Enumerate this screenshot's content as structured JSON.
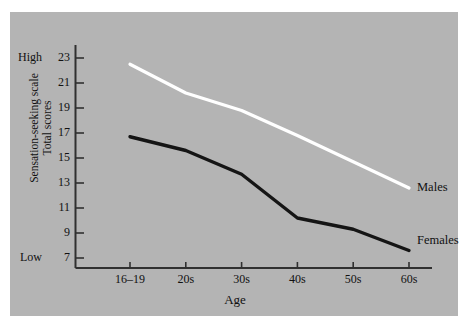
{
  "figure": {
    "background_color": "#b4b4b4",
    "page_color": "#ffffff"
  },
  "axes": {
    "y_title_line1": "Sensation-seeking scale",
    "y_title_line2": "Total scores",
    "y_high_anchor": "High",
    "y_low_anchor": "Low",
    "x_title": "Age"
  },
  "series_labels": {
    "males": "Males",
    "females": "Females"
  },
  "chart_data": {
    "type": "line",
    "title": "",
    "xlabel": "Age",
    "ylabel": "Sensation-seeking scale Total scores",
    "categories": [
      "16–19",
      "20s",
      "30s",
      "40s",
      "50s",
      "60s"
    ],
    "ytick_labels": [
      "23",
      "21",
      "19",
      "17",
      "15",
      "13",
      "11",
      "9",
      "7"
    ],
    "ytick_values": [
      23,
      21,
      19,
      17,
      15,
      13,
      11,
      9,
      7
    ],
    "ylim": [
      6,
      24
    ],
    "xtick_labels": [
      "16–19",
      "20s",
      "30s",
      "40s",
      "50s",
      "60s"
    ],
    "grid": false,
    "legend": "inline-right",
    "annotations": [
      {
        "text": "High",
        "at_y": 23
      },
      {
        "text": "Low",
        "at_y": 7
      },
      {
        "text": "Males",
        "at_x": "60s",
        "at_y": 12.6
      },
      {
        "text": "Females",
        "at_x": "60s",
        "at_y": 7.6
      }
    ],
    "series": [
      {
        "name": "Males",
        "color": "#ffffff",
        "values": [
          22.5,
          20.2,
          18.8,
          16.8,
          14.7,
          12.6
        ]
      },
      {
        "name": "Females",
        "color": "#151515",
        "values": [
          16.7,
          15.6,
          13.7,
          10.2,
          9.3,
          7.6
        ]
      }
    ]
  }
}
